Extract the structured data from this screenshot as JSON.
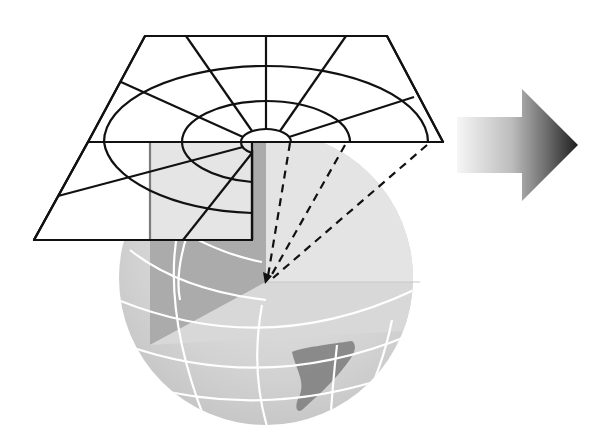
{
  "figure": {
    "colors": {
      "background": "#ffffff",
      "grid_line": "#111111",
      "globe_fill": "#d4d4d4",
      "globe_light": "#e2e2e2",
      "globe_dark_wedge": "#a9a9a9",
      "graticule": "#ffffff",
      "land": "#7a7a7a",
      "arrow_start": "#f2f2f2",
      "arrow_end": "#222222"
    },
    "plane": {
      "top_left": [
        145,
        36
      ],
      "top_right": [
        387,
        36
      ],
      "right": [
        443,
        142
      ],
      "bottom_left": [
        34,
        240
      ],
      "cut_line_y": 142,
      "cut_x": 252,
      "center": [
        266,
        142
      ],
      "circles": [
        {
          "rx": 25,
          "ry": 13
        },
        {
          "rx": 84,
          "ry": 41
        },
        {
          "rx": 162,
          "ry": 76
        }
      ]
    },
    "globe": {
      "cx": 266,
      "cy": 278,
      "r": 147
    },
    "projection_rays": {
      "origin": [
        266,
        282
      ],
      "targets": [
        [
          290,
          143
        ],
        [
          345,
          145
        ],
        [
          427,
          145
        ]
      ]
    },
    "arrow": {
      "shaft": [
        457,
        117,
        522,
        173
      ],
      "head": [
        [
          522,
          89
        ],
        [
          578,
          145
        ],
        [
          522,
          201
        ]
      ]
    }
  }
}
